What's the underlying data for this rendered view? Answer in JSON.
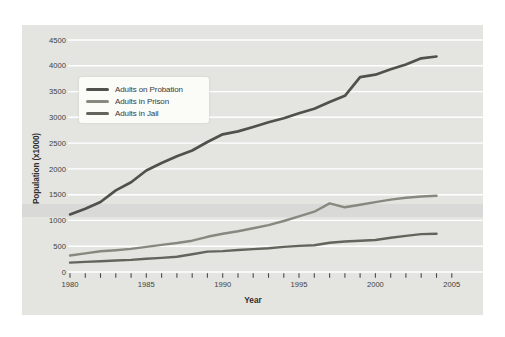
{
  "chart_data": {
    "type": "line",
    "title": "",
    "xlabel": "Year",
    "ylabel": "Population (x1000)",
    "xlim": [
      1980,
      2005
    ],
    "ylim": [
      0,
      4500
    ],
    "y_ticks": [
      0,
      500,
      1000,
      1500,
      2000,
      2500,
      3000,
      3500,
      4000,
      4500
    ],
    "x_major_ticks": [
      1980,
      1985,
      1990,
      1995,
      2000,
      2005
    ],
    "x_minor_tick_interval": 1,
    "grid": "horizontal-white-on-gray-panel",
    "legend_position": "upper-left-inside",
    "years": [
      1980,
      1981,
      1982,
      1983,
      1984,
      1985,
      1986,
      1987,
      1988,
      1989,
      1990,
      1991,
      1992,
      1993,
      1994,
      1995,
      1996,
      1997,
      1998,
      1999,
      2000,
      2001,
      2002,
      2003,
      2004
    ],
    "series": [
      {
        "name": "Adults on Probation",
        "color": "#50514b",
        "values": [
          1118,
          1225,
          1357,
          1582,
          1740,
          1969,
          2114,
          2247,
          2356,
          2522,
          2670,
          2728,
          2812,
          2903,
          2981,
          3078,
          3165,
          3297,
          3417,
          3780,
          3826,
          3932,
          4024,
          4145,
          4180
        ]
      },
      {
        "name": "Adults in Prison",
        "color": "#87897f",
        "values": [
          320,
          360,
          402,
          423,
          448,
          487,
          526,
          562,
          607,
          683,
          743,
          792,
          850,
          909,
          990,
          1078,
          1170,
          1330,
          1255,
          1305,
          1355,
          1405,
          1440,
          1465,
          1480
        ]
      },
      {
        "name": "Adults in Jail",
        "color": "#63655c",
        "values": [
          182,
          196,
          209,
          223,
          234,
          256,
          274,
          295,
          343,
          395,
          405,
          426,
          444,
          459,
          486,
          507,
          518,
          567,
          592,
          605,
          621,
          665,
          700,
          735,
          740
        ]
      }
    ]
  },
  "colors": {
    "page_bg": "#ffffff",
    "panel_bg": "#e4e4e1",
    "gridline": "#ffffff",
    "tick": "#4a4a46",
    "tick_label": "#3f3f3b",
    "axis_title": "#2e2e2a",
    "legend_bg": "#fbfbf8",
    "artifact_band": "rgba(90,90,85,0.07)"
  }
}
